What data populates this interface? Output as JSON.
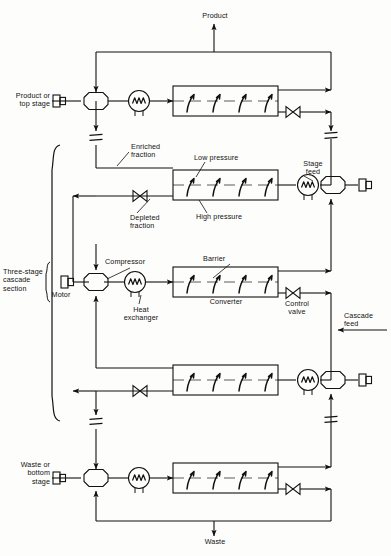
{
  "diagram": {
    "stroke_color": "#111111",
    "background_color": "#fdfdfb"
  },
  "labels": {
    "product": "Product",
    "waste": "Waste",
    "product_or_top_stage": "Product or\ntop stage",
    "waste_or_bottom_stage": "Waste or\nbottom\nstage",
    "three_stage_cascade_section": "Three-stage\ncascade\nsection",
    "motor": "Motor",
    "compressor": "Compressor",
    "heat_exchanger": "Heat\nexchanger",
    "enriched_fraction": "Enriched\nfraction",
    "depleted_fraction": "Depleted\nfraction",
    "low_pressure": "Low pressure",
    "high_pressure": "High pressure",
    "stage_feed": "Stage\nfeed",
    "barrier": "Barrier",
    "converter": "Converter",
    "control_valve": "Control\nvalve",
    "cascade_feed": "Cascade\nfeed"
  },
  "components": {
    "stages": [
      {
        "name": "top-stage",
        "row_y": 101
      },
      {
        "name": "second-stage",
        "row_y": 185
      },
      {
        "name": "third-stage",
        "row_y": 282
      },
      {
        "name": "fourth-stage",
        "row_y": 380
      },
      {
        "name": "bottom-stage",
        "row_y": 478
      }
    ],
    "symbols": [
      "motor-symbol",
      "compressor-symbol",
      "heat-exchanger-symbol",
      "converter-box",
      "barrier-line",
      "diffusion-arrow",
      "control-valve-symbol",
      "line-break-symbol",
      "flow-arrow"
    ]
  }
}
